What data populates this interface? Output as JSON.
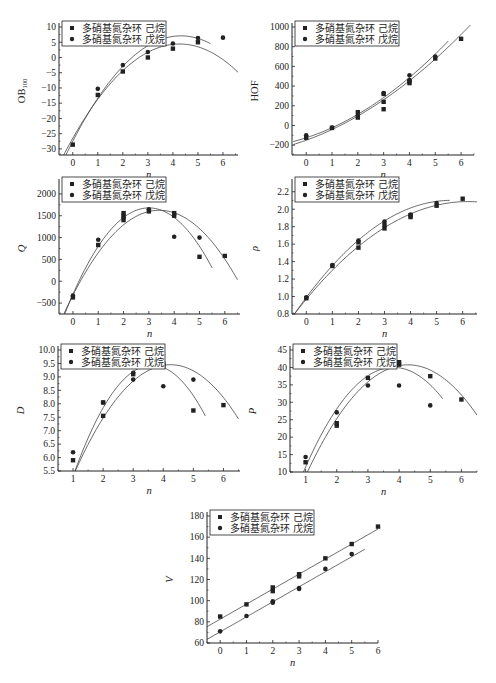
{
  "figure": {
    "legend": {
      "series_a": "多硝基氮杂环 己烷",
      "series_b": "多硝基氮杂环 戊烷"
    },
    "colors": {
      "ink": "#222222",
      "curve": "#444444",
      "background": "#ffffff"
    }
  },
  "chart_data": [
    {
      "id": "ob100",
      "type": "scatter",
      "title": "",
      "xlabel": "n",
      "ylabel": "OB100",
      "ylabel_main": "OB",
      "ylabel_sub": "100",
      "xlim": [
        -0.55,
        6.6
      ],
      "ylim": [
        -32,
        10
      ],
      "xticks": [
        0,
        1,
        2,
        3,
        4,
        5,
        6
      ],
      "yticks": [
        -30,
        -25,
        -20,
        -15,
        -10,
        -5,
        0,
        5,
        10
      ],
      "grid": false,
      "legend_position": "upper-left",
      "box": {
        "left": 59,
        "top": 27,
        "right": 238,
        "bottom": 155
      },
      "series": [
        {
          "name": "多硝基氮杂环 己烷",
          "marker": "square",
          "points": [
            [
              0,
              -28.6
            ],
            [
              1,
              -12.3
            ],
            [
              2,
              -4.6
            ],
            [
              3,
              0
            ],
            [
              4,
              2.9
            ],
            [
              5,
              5.0
            ]
          ],
          "fit": {
            "kind": "quadratic",
            "coef": [
              -26.5,
              14.5,
              -1.7
            ],
            "range": [
              -0.4,
              6.6
            ]
          }
        },
        {
          "name": "多硝基氮杂环 戊烷",
          "marker": "circle",
          "points": [
            [
              1,
              -10.3
            ],
            [
              2,
              -2.5
            ],
            [
              3,
              1.8
            ],
            [
              4,
              4.6
            ],
            [
              5,
              6.4
            ],
            [
              6,
              6.5
            ]
          ],
          "fit": {
            "kind": "quadratic",
            "coef": [
              -27.5,
              16.0,
              -1.85
            ],
            "range": [
              -0.35,
              5.5
            ]
          }
        }
      ]
    },
    {
      "id": "hof",
      "type": "scatter",
      "title": "",
      "xlabel": "n",
      "ylabel": "HOF",
      "xlim": [
        -0.55,
        6.5
      ],
      "ylim": [
        -300,
        1000
      ],
      "xticks": [
        0,
        1,
        2,
        3,
        4,
        5,
        6
      ],
      "yticks": [
        -200,
        0,
        200,
        400,
        600,
        800,
        1000
      ],
      "grid": false,
      "legend_position": "upper-left",
      "box": {
        "left": 292,
        "top": 27,
        "right": 474,
        "bottom": 155
      },
      "series": [
        {
          "name": "多硝基氮杂环 己烷",
          "marker": "square",
          "points": [
            [
              0,
              -125
            ],
            [
              1,
              -25
            ],
            [
              2,
              80
            ],
            [
              2,
              135
            ],
            [
              3,
              165
            ],
            [
              3,
              240
            ],
            [
              3,
              320
            ],
            [
              4,
              430
            ],
            [
              4,
              450
            ],
            [
              5,
              680
            ],
            [
              6,
              880
            ]
          ],
          "fit": {
            "kind": "quadratic",
            "coef": [
              -150,
              95,
              14
            ],
            "range": [
              -0.5,
              6.5
            ]
          }
        },
        {
          "name": "多硝基氮杂环 戊烷",
          "marker": "circle",
          "points": [
            [
              0,
              -100
            ],
            [
              1,
              -20
            ],
            [
              2,
              100
            ],
            [
              3,
              330
            ],
            [
              4,
              510
            ],
            [
              4,
              460
            ],
            [
              5,
              700
            ]
          ],
          "fit": {
            "kind": "quadratic",
            "coef": [
              -125,
              85,
              17
            ],
            "range": [
              -0.5,
              5.5
            ]
          }
        }
      ]
    },
    {
      "id": "q",
      "type": "scatter",
      "title": "",
      "xlabel": "n",
      "ylabel": "Q",
      "xlim": [
        -0.55,
        6.6
      ],
      "ylim": [
        -750,
        2250
      ],
      "xticks": [
        0,
        1,
        2,
        3,
        4,
        5,
        6
      ],
      "yticks": [
        -500,
        0,
        500,
        1000,
        1500,
        2000
      ],
      "grid": false,
      "legend_position": "upper-left",
      "box": {
        "left": 59,
        "top": 183,
        "right": 240,
        "bottom": 314
      },
      "series": [
        {
          "name": "多硝基氮杂环 己烷",
          "marker": "square",
          "points": [
            [
              0,
              -370
            ],
            [
              1,
              830
            ],
            [
              2,
              1400
            ],
            [
              2,
              1500
            ],
            [
              2,
              1560
            ],
            [
              3,
              1600
            ],
            [
              4,
              1500
            ],
            [
              4,
              1560
            ],
            [
              5,
              560
            ],
            [
              6,
              580
            ]
          ],
          "fit": {
            "kind": "quadratic",
            "coef": [
              -320,
              1140,
              -167
            ],
            "range": [
              -0.35,
              6.5
            ]
          }
        },
        {
          "name": "多硝基氮杂环 戊烷",
          "marker": "circle",
          "points": [
            [
              0,
              -330
            ],
            [
              1,
              950
            ],
            [
              2,
              1460
            ],
            [
              3,
              1650
            ],
            [
              4,
              1020
            ],
            [
              5,
              1000
            ]
          ],
          "fit": {
            "kind": "quadratic",
            "coef": [
              -300,
              1320,
              -220
            ],
            "range": [
              -0.45,
              5.5
            ]
          }
        }
      ]
    },
    {
      "id": "rho",
      "type": "scatter",
      "title": "",
      "xlabel": "n",
      "ylabel": "ρ",
      "xlim": [
        -0.55,
        6.55
      ],
      "ylim": [
        0.8,
        2.3
      ],
      "xticks": [
        0,
        1,
        2,
        3,
        4,
        5,
        6
      ],
      "yticks": [
        0.8,
        1.0,
        1.2,
        1.4,
        1.6,
        1.8,
        2.0,
        2.2
      ],
      "grid": false,
      "legend_position": "upper-left",
      "box": {
        "left": 292,
        "top": 183,
        "right": 477,
        "bottom": 314
      },
      "series": [
        {
          "name": "多硝基氮杂环 己烷",
          "marker": "square",
          "points": [
            [
              0,
              0.98
            ],
            [
              1,
              1.35
            ],
            [
              2,
              1.56
            ],
            [
              2,
              1.62
            ],
            [
              3,
              1.78
            ],
            [
              3,
              1.82
            ],
            [
              4,
              1.91
            ],
            [
              4,
              1.93
            ],
            [
              5,
              2.04
            ],
            [
              6,
              2.12
            ]
          ],
          "fit": {
            "kind": "quadratic",
            "coef": [
              0.97,
              0.36,
              -0.029
            ],
            "range": [
              -0.55,
              6.55
            ]
          }
        },
        {
          "name": "多硝基氮杂环 戊烷",
          "marker": "circle",
          "points": [
            [
              0,
              0.99
            ],
            [
              1,
              1.36
            ],
            [
              2,
              1.64
            ],
            [
              3,
              1.86
            ],
            [
              4,
              1.94
            ],
            [
              5,
              2.07
            ]
          ],
          "fit": {
            "kind": "quadratic",
            "coef": [
              0.99,
              0.4,
              -0.036
            ],
            "range": [
              -0.5,
              5.5
            ]
          }
        }
      ]
    },
    {
      "id": "d",
      "type": "scatter",
      "title": "",
      "xlabel": "n",
      "ylabel": "D",
      "xlim": [
        0.5,
        6.55
      ],
      "ylim": [
        5.5,
        10.0
      ],
      "xticks": [
        1,
        2,
        3,
        4,
        5,
        6
      ],
      "yticks": [
        5.5,
        6.0,
        6.5,
        7.0,
        7.5,
        8.0,
        8.5,
        9.0,
        9.5,
        10.0
      ],
      "grid": false,
      "legend_position": "upper-left",
      "box": {
        "left": 58,
        "top": 350,
        "right": 240,
        "bottom": 471
      },
      "series": [
        {
          "name": "多硝基氮杂环 己烷",
          "marker": "square",
          "points": [
            [
              1,
              5.9
            ],
            [
              2,
              7.55
            ],
            [
              2,
              8.05
            ],
            [
              3,
              9.1
            ],
            [
              4,
              9.4
            ],
            [
              4,
              9.5
            ],
            [
              5,
              7.75
            ],
            [
              6,
              7.95
            ]
          ],
          "fit": {
            "kind": "quadratic",
            "coef": [
              2.35,
              3.35,
              -0.395
            ],
            "range": [
              0.85,
              6.5
            ]
          }
        },
        {
          "name": "多硝基氮杂环 戊烷",
          "marker": "circle",
          "points": [
            [
              1,
              6.2
            ],
            [
              2,
              8.05
            ],
            [
              3,
              8.9
            ],
            [
              3,
              9.15
            ],
            [
              4,
              8.65
            ],
            [
              5,
              8.9
            ]
          ],
          "fit": {
            "kind": "quadratic",
            "coef": [
              1.55,
              4.35,
              -0.6
            ],
            "range": [
              0.8,
              5.4
            ]
          }
        }
      ]
    },
    {
      "id": "p",
      "type": "scatter",
      "title": "",
      "xlabel": "n",
      "ylabel": "P",
      "xlim": [
        0.5,
        6.5
      ],
      "ylim": [
        10,
        45
      ],
      "xticks": [
        1,
        2,
        3,
        4,
        5,
        6
      ],
      "yticks": [
        10,
        15,
        20,
        25,
        30,
        35,
        40,
        45
      ],
      "grid": false,
      "legend_position": "upper-left",
      "box": {
        "left": 290,
        "top": 350,
        "right": 477,
        "bottom": 472
      },
      "series": [
        {
          "name": "多硝基氮杂环 己烷",
          "marker": "square",
          "points": [
            [
              1,
              12.8
            ],
            [
              2,
              23.3
            ],
            [
              2,
              24
            ],
            [
              3,
              37
            ],
            [
              4,
              40.8
            ],
            [
              4,
              41.5
            ],
            [
              5,
              37.5
            ],
            [
              6,
              30.8
            ]
          ],
          "fit": {
            "kind": "quadratic",
            "coef": [
              -13.5,
              25.3,
              -2.95
            ],
            "range": [
              0.95,
              6.5
            ]
          }
        },
        {
          "name": "多硝基氮杂环 戊烷",
          "marker": "circle",
          "points": [
            [
              1,
              14.3
            ],
            [
              2,
              27.1
            ],
            [
              3,
              34.8
            ],
            [
              4,
              34.8
            ],
            [
              5,
              29.1
            ]
          ],
          "fit": {
            "kind": "quadratic",
            "coef": [
              -12.5,
              27.5,
              -3.6
            ],
            "range": [
              0.85,
              5.4
            ]
          }
        }
      ]
    },
    {
      "id": "v",
      "type": "scatter",
      "title": "",
      "xlabel": "n",
      "ylabel": "V",
      "xlim": [
        -0.5,
        6.0
      ],
      "ylim": [
        60,
        180
      ],
      "xticks": [
        0,
        1,
        2,
        3,
        4,
        5,
        6
      ],
      "yticks": [
        60,
        80,
        100,
        120,
        140,
        160,
        180
      ],
      "grid": false,
      "legend_position": "upper-left",
      "box": {
        "left": 207,
        "top": 516,
        "right": 378,
        "bottom": 643
      },
      "series": [
        {
          "name": "多硝基氮杂环 己烷",
          "marker": "square",
          "points": [
            [
              0,
              85
            ],
            [
              1,
              96.5
            ],
            [
              2,
              109
            ],
            [
              2,
              112.5
            ],
            [
              3,
              123
            ],
            [
              3,
              125
            ],
            [
              4,
              140
            ],
            [
              5,
              153.5
            ],
            [
              6,
              170
            ]
          ],
          "fit": {
            "kind": "linear",
            "coef": [
              82.5,
              14.2
            ],
            "range": [
              -0.5,
              6.0
            ]
          }
        },
        {
          "name": "多硝基氮杂环 戊烷",
          "marker": "circle",
          "points": [
            [
              0,
              71
            ],
            [
              1,
              85.5
            ],
            [
              2,
              98
            ],
            [
              2,
              99.5
            ],
            [
              3,
              111
            ],
            [
              3,
              112
            ],
            [
              4,
              130
            ],
            [
              5,
              144
            ]
          ],
          "fit": {
            "kind": "linear",
            "coef": [
              70.5,
              14.2
            ],
            "range": [
              -0.5,
              5.5
            ]
          }
        }
      ]
    }
  ]
}
